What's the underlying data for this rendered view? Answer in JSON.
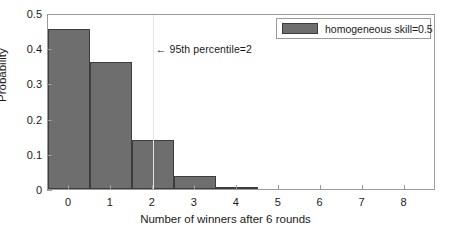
{
  "chart_data": {
    "type": "bar",
    "title": "",
    "subtitle": "",
    "xlabel": "Number of winners after 6 rounds",
    "ylabel": "Probability",
    "categories": [
      "0",
      "1",
      "2",
      "3",
      "4",
      "5",
      "6",
      "7",
      "8"
    ],
    "values": [
      0.456,
      0.36,
      0.14,
      0.037,
      0.007,
      0.0005,
      0.0,
      0.0,
      0.0
    ],
    "series": [
      {
        "name": "homogeneous skill=0.5",
        "values": [
          0.456,
          0.36,
          0.14,
          0.037,
          0.007,
          0.0005,
          0.0,
          0.0,
          0.0
        ]
      }
    ],
    "xlim": [
      -0.5,
      8.75
    ],
    "ylim": [
      0,
      0.5
    ],
    "xticks": [
      0,
      1,
      2,
      3,
      4,
      5,
      6,
      7,
      8
    ],
    "xtick_labels": [
      "0",
      "1",
      "2",
      "3",
      "4",
      "5",
      "6",
      "7",
      "8"
    ],
    "yticks": [
      0,
      0.1,
      0.2,
      0.3,
      0.4,
      0.5
    ],
    "ytick_labels": [
      "0",
      "0.1",
      "0.2",
      "0.3",
      "0.4",
      "0.5"
    ],
    "grid": false,
    "legend_position": "top-right",
    "bar_color": "#6e6e6e",
    "bar_edge_color": "#3d3d3d",
    "axis_color": "#9a9a9a",
    "annotations": [
      {
        "name": "percentile-line",
        "text": "← 95th percentile=2",
        "x_value": 2,
        "y_value": 0.4,
        "line_color": "#e3e3e3"
      }
    ]
  },
  "legend": {
    "entries": [
      {
        "label": "homogeneous skill=0.5",
        "color": "#6e6e6e"
      }
    ]
  }
}
